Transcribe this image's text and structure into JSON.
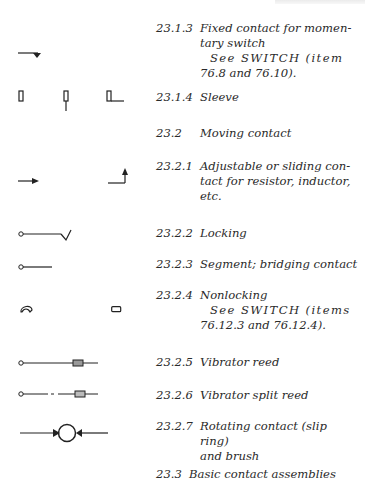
{
  "running_header": "",
  "entries": [
    {
      "number": "23.1.3",
      "title": "Fixed contact for momen-",
      "title2": "tary switch",
      "see": "See SWITCH (item",
      "see2": "76.8 and 76.10).",
      "symbols": [
        "fixed-contact-momentary"
      ]
    },
    {
      "number": "23.1.4",
      "title": "Sleeve",
      "symbols": [
        "sleeve-1",
        "sleeve-2",
        "sleeve-3"
      ]
    },
    {
      "number": "23.2",
      "title": "Moving contact"
    },
    {
      "number": "23.2.1",
      "title": "Adjustable or sliding con-",
      "title2": "tact for resistor, inductor,",
      "title3": "etc.",
      "symbols": [
        "arrow-right",
        "arrow-up-corner"
      ]
    },
    {
      "number": "23.2.2",
      "title": "Locking",
      "symbols": [
        "locking-contact"
      ]
    },
    {
      "number": "23.2.3",
      "title": "Segment; bridging contact",
      "symbols": [
        "segment-contact"
      ]
    },
    {
      "number": "23.2.4",
      "title": "Nonlocking",
      "see": "See SWITCH (items",
      "see2": "76.12.3 and 76.12.4).",
      "symbols": [
        "nonlocking-1",
        "nonlocking-2"
      ]
    },
    {
      "number": "23.2.5",
      "title": "Vibrator reed",
      "symbols": [
        "vibrator-reed"
      ]
    },
    {
      "number": "23.2.6",
      "title": "Vibrator split reed",
      "symbols": [
        "vibrator-split-reed"
      ]
    },
    {
      "number": "23.2.7",
      "title": "Rotating contact (slip ring)",
      "title2": "and brush",
      "symbols": [
        "slip-ring-brush"
      ]
    },
    {
      "number": "23.3",
      "title": "Basic contact assemblies"
    }
  ]
}
